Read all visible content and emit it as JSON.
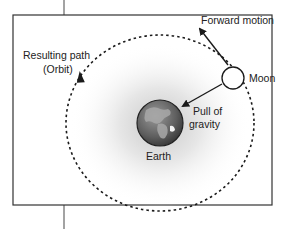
{
  "diagram": {
    "labels": {
      "forward_motion": "Forward motion",
      "moon": "Moon",
      "resulting_path_line1": "Resulting path",
      "resulting_path_line2": "(Orbit)",
      "pull_line1": "Pull of",
      "pull_line2": "gravity",
      "earth": "Earth"
    },
    "colors": {
      "line": "#1a1a1a",
      "frame": "#333333",
      "glow": "#d8d8d8",
      "earth_ocean": "#6b6b6b",
      "earth_land": "#a8a8a8"
    }
  }
}
